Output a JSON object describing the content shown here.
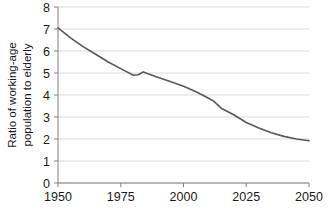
{
  "chart_data": {
    "type": "line",
    "title": "",
    "subtitle": "",
    "xlabel": "",
    "ylabel_line1": "Ratio of working-age",
    "ylabel_line2": "population to elderly",
    "ylabel": "Ratio of working-age population to elderly",
    "xlim": [
      1950,
      2050
    ],
    "ylim": [
      0,
      8
    ],
    "xticks": [
      1950,
      1975,
      2000,
      2025,
      2050
    ],
    "xtick_labels": [
      "1950",
      "1975",
      "2000",
      "2025",
      "2050"
    ],
    "yticks": [
      0,
      1,
      2,
      3,
      4,
      5,
      6,
      7,
      8
    ],
    "ytick_labels": [
      "0",
      "1",
      "2",
      "3",
      "4",
      "5",
      "6",
      "7",
      "8"
    ],
    "grid": "horizontal",
    "legend": "none",
    "line_color": "#595959",
    "grid_color": "#d9d9d9",
    "axis_color": "#808080",
    "text_color": "#1a1a1a",
    "series": [
      {
        "name": "Ratio of working-age population to elderly",
        "x": [
          1950,
          1955,
          1960,
          1965,
          1970,
          1975,
          1980,
          1982,
          1984,
          1985,
          1990,
          1995,
          2000,
          2005,
          2010,
          2012,
          2015,
          2020,
          2025,
          2030,
          2035,
          2040,
          2045,
          2050
        ],
        "values": [
          7.05,
          6.6,
          6.2,
          5.85,
          5.5,
          5.2,
          4.9,
          4.92,
          5.05,
          5.0,
          4.8,
          4.6,
          4.4,
          4.15,
          3.85,
          3.72,
          3.4,
          3.1,
          2.75,
          2.5,
          2.28,
          2.12,
          2.0,
          1.92
        ]
      }
    ]
  },
  "plot_geometry": {
    "left": 58,
    "right": 309,
    "top": 7,
    "bottom": 183
  }
}
